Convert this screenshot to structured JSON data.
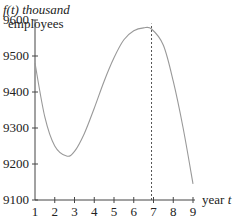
{
  "chart_data": {
    "type": "line",
    "title": "",
    "ylabel_line1": "f(t) thousand",
    "ylabel_line2": "employees",
    "xlabel": "year t",
    "x_ticks": [
      1,
      2,
      3,
      4,
      5,
      6,
      7,
      8,
      9
    ],
    "x_tick_labels": [
      "1",
      "2",
      "3",
      "4",
      "5",
      "6",
      "7",
      "8",
      "9"
    ],
    "y_ticks": [
      9100,
      9200,
      9300,
      9400,
      9500,
      9600
    ],
    "y_tick_labels": [
      "9100",
      "9200",
      "9300",
      "9400",
      "9500",
      "9600"
    ],
    "xlim": [
      1,
      9
    ],
    "ylim": [
      9100,
      9600
    ],
    "grid": false,
    "series": [
      {
        "name": "f(t)",
        "x": [
          1,
          1.5,
          2,
          2.6,
          3,
          3.5,
          4,
          4.5,
          5,
          5.5,
          6,
          6.5,
          6.9,
          7.5,
          8,
          8.5,
          9
        ],
        "values": [
          9480,
          9330,
          9250,
          9222,
          9235,
          9285,
          9355,
          9430,
          9495,
          9545,
          9570,
          9578,
          9575,
          9530,
          9430,
          9300,
          9145
        ]
      }
    ],
    "annotations": [
      {
        "type": "vertical-dashed-line",
        "x": 6.9,
        "from_y": 9100,
        "to_y": 9590
      }
    ]
  }
}
